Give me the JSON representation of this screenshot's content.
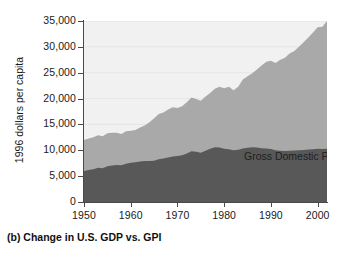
{
  "figure": {
    "caption": "(b) Change in U.S. GDP vs. GPI"
  },
  "colors": {
    "plot_background": "#f1f1f1",
    "gdp_band": "#a9a9a9",
    "gpi_band": "#585858",
    "axis": "#4a4a4a",
    "gridline": "#e6e6e6",
    "text": "#1a1a1a",
    "gpi_label_text": "#ffffff"
  },
  "chart_data": {
    "type": "area",
    "stacked": true,
    "title": "",
    "subtitle": "",
    "xlabel": "",
    "ylabel": "1996 dollars per capita",
    "xlim": [
      1950,
      2002
    ],
    "ylim": [
      0,
      35000
    ],
    "grid": true,
    "grid_axis": "y",
    "legend_position": "inline-annotation",
    "xticks": [
      1950,
      1960,
      1970,
      1980,
      1990,
      2000
    ],
    "xticklabels": [
      "1950",
      "1960",
      "1970",
      "1980",
      "1990",
      "2000"
    ],
    "yticks": [
      0,
      5000,
      10000,
      15000,
      20000,
      25000,
      30000,
      35000
    ],
    "yticklabels": [
      "0",
      "5,000",
      "10,000",
      "15,000",
      "20,000",
      "25,000",
      "30,000",
      "35,000"
    ],
    "annotations": [
      {
        "text": "Gross Domestic Product (GDP)",
        "series": "GDP",
        "color": "#1e1e1e"
      },
      {
        "text": "Genuine Progress Indicator (GPI)",
        "series": "GPI",
        "color": "#ffffff"
      }
    ],
    "x": [
      1950,
      1951,
      1952,
      1953,
      1954,
      1955,
      1956,
      1957,
      1958,
      1959,
      1960,
      1961,
      1962,
      1963,
      1964,
      1965,
      1966,
      1967,
      1968,
      1969,
      1970,
      1971,
      1972,
      1973,
      1974,
      1975,
      1976,
      1977,
      1978,
      1979,
      1980,
      1981,
      1982,
      1983,
      1984,
      1985,
      1986,
      1987,
      1988,
      1989,
      1990,
      1991,
      1992,
      1993,
      1994,
      1995,
      1996,
      1997,
      1998,
      1999,
      2000,
      2001,
      2002
    ],
    "series": [
      {
        "name": "Genuine Progress Indicator (GPI)",
        "color": "#585858",
        "values": [
          6000,
          6200,
          6350,
          6600,
          6550,
          6900,
          7050,
          7150,
          7100,
          7400,
          7600,
          7700,
          7850,
          7950,
          7950,
          8000,
          8250,
          8400,
          8600,
          8800,
          8900,
          9050,
          9400,
          9800,
          9700,
          9500,
          9900,
          10300,
          10600,
          10550,
          10300,
          10200,
          10000,
          10100,
          10350,
          10500,
          10600,
          10550,
          10400,
          10350,
          10250,
          10000,
          9900,
          9850,
          9900,
          9950,
          10000,
          10050,
          10150,
          10200,
          10300,
          10250,
          10300
        ]
      },
      {
        "name": "Gross Domestic Product (GDP)",
        "color": "#a9a9a9",
        "values": [
          12000,
          12300,
          12500,
          12900,
          12700,
          13300,
          13400,
          13400,
          13150,
          13700,
          13800,
          13900,
          14400,
          14800,
          15400,
          16200,
          17000,
          17300,
          17900,
          18300,
          18200,
          18500,
          19300,
          20200,
          19900,
          19600,
          20400,
          21100,
          21900,
          22300,
          22000,
          22300,
          21600,
          22300,
          23700,
          24300,
          24900,
          25600,
          26400,
          27100,
          27300,
          26900,
          27500,
          27900,
          28700,
          29200,
          30000,
          30900,
          31800,
          32800,
          33800,
          33900,
          35000
        ]
      }
    ],
    "notes": {
      "gdp_values_are_totals": true,
      "description": "GDP is the upper (total) curve; GPI is the lower filled band. The light band between the two curves is shaded as the GDP region."
    }
  }
}
